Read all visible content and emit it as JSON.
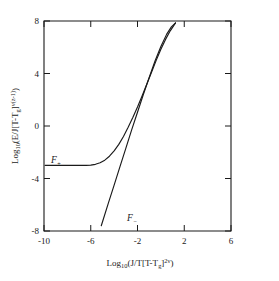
{
  "chart_data": {
    "type": "line",
    "title": "",
    "xlabel": "Log10(J/T[T-Tg]^2v)",
    "ylabel": "Log10(E/J[T-Tg]^v(z-1))",
    "xlim": [
      -10,
      6
    ],
    "ylim": [
      -8,
      8
    ],
    "xticks": [
      -10,
      -6,
      -2,
      2,
      6
    ],
    "yticks": [
      -8,
      -4,
      0,
      4,
      8
    ],
    "xtick_labels": [
      "-10",
      "-6",
      "-2",
      "2",
      "6"
    ],
    "ytick_labels": [
      "-8",
      "-4",
      "0",
      "4",
      "8"
    ],
    "grid": false,
    "legend": "inline-annotations",
    "series": [
      {
        "name": "F+",
        "label": "F",
        "label_sub": "+",
        "description": "upper branch: plateau at y = -3 for x < -6, rising crossover to asymptotic slope ~2",
        "points": [
          [
            -9.9,
            -3.0
          ],
          [
            -9.0,
            -3.0
          ],
          [
            -8.0,
            -3.0
          ],
          [
            -7.0,
            -3.0
          ],
          [
            -6.4,
            -3.0
          ],
          [
            -6.0,
            -2.98
          ],
          [
            -5.6,
            -2.92
          ],
          [
            -5.2,
            -2.8
          ],
          [
            -4.8,
            -2.6
          ],
          [
            -4.4,
            -2.3
          ],
          [
            -4.0,
            -1.9
          ],
          [
            -3.6,
            -1.4
          ],
          [
            -3.2,
            -0.8
          ],
          [
            -2.8,
            -0.1
          ],
          [
            -2.4,
            0.65
          ],
          [
            -2.0,
            1.45
          ],
          [
            -1.6,
            2.3
          ],
          [
            -1.2,
            3.2
          ],
          [
            -0.8,
            4.1
          ],
          [
            -0.4,
            5.0
          ],
          [
            0.0,
            5.85
          ],
          [
            0.4,
            6.6
          ],
          [
            0.8,
            7.25
          ],
          [
            1.1,
            7.65
          ],
          [
            1.25,
            7.85
          ]
        ]
      },
      {
        "name": "F-",
        "label": "F",
        "label_sub": "−",
        "description": "lower branch: near-straight line of slope ~2.9 from (-5.1,-7.6) up to merge with F+ near (1.25,7.85)",
        "points": [
          [
            -5.1,
            -7.6
          ],
          [
            -4.5,
            -5.9
          ],
          [
            -4.0,
            -4.5
          ],
          [
            -3.5,
            -3.1
          ],
          [
            -3.0,
            -1.7
          ],
          [
            -2.5,
            -0.3
          ],
          [
            -2.0,
            1.05
          ],
          [
            -1.5,
            2.4
          ],
          [
            -1.0,
            3.7
          ],
          [
            -0.5,
            4.95
          ],
          [
            0.0,
            6.05
          ],
          [
            0.5,
            7.0
          ],
          [
            0.9,
            7.55
          ],
          [
            1.25,
            7.85
          ]
        ]
      }
    ],
    "annotations": [
      {
        "name": "F-plus-label",
        "text": "F",
        "sub": "+",
        "x": -9.3,
        "y": -2.1
      },
      {
        "name": "F-minus-label",
        "text": "F",
        "sub": "−",
        "x": -3.0,
        "y": -6.9
      }
    ]
  },
  "axis": {
    "x_label_parts": {
      "lead": "Log",
      "lead_sub": "10",
      "open": "(J/T[T-T",
      "g_sub": "g",
      "close": "]",
      "exp": "2ν",
      "tail": ")"
    },
    "y_label_parts": {
      "lead": "Log",
      "lead_sub": "10",
      "open": "(E/J[T-T",
      "g_sub": "g",
      "close": "]",
      "exp": "ν(z-1)",
      "tail": ")"
    }
  },
  "colors": {
    "background": "#ffffff",
    "ink": "#1a1a1a",
    "curve": "#1a1a1a"
  }
}
